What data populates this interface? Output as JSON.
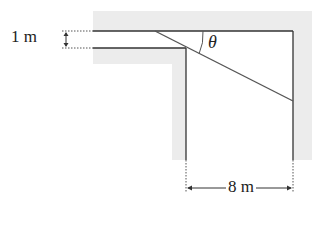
{
  "diagram": {
    "labels": {
      "corridor_width": "1 m",
      "angle": "θ",
      "corridor_gap": "8 m"
    },
    "colors": {
      "wall_fill": "#ececec",
      "line": "#333333",
      "ladder": "#555555",
      "background": "#ffffff"
    },
    "elements": {
      "horizontal_corridor_width": "1 m",
      "vertical_corridor_width": "8 m",
      "ladder": "diagonal line touching inner corner",
      "angle_marker": "θ between ladder and top wall"
    }
  }
}
